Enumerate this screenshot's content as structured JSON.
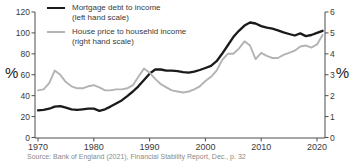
{
  "chart_data": {
    "type": "line",
    "x": [
      1970,
      1971,
      1972,
      1973,
      1974,
      1975,
      1976,
      1977,
      1978,
      1979,
      1980,
      1981,
      1982,
      1983,
      1984,
      1985,
      1986,
      1987,
      1988,
      1989,
      1990,
      1991,
      1992,
      1993,
      1994,
      1995,
      1996,
      1997,
      1998,
      1999,
      2000,
      2001,
      2002,
      2003,
      2004,
      2005,
      2006,
      2007,
      2008,
      2009,
      2010,
      2011,
      2012,
      2013,
      2014,
      2015,
      2016,
      2017,
      2018,
      2019,
      2020,
      2021
    ],
    "series": [
      {
        "id": "mortgage-debt-to-income",
        "name": "Mortgage debt to income",
        "scale_note": "(left hand scale)",
        "axis": "left",
        "color": "#1a1a1a",
        "values": [
          26,
          26.5,
          27.5,
          29.5,
          30,
          28.5,
          27,
          26.5,
          27,
          27.5,
          27.5,
          25.5,
          27,
          29.5,
          32.5,
          35.5,
          39.5,
          44,
          49,
          55,
          61,
          65,
          65,
          64,
          64,
          63.5,
          62.5,
          62,
          63,
          64.5,
          66.5,
          68.5,
          73,
          80,
          88,
          96,
          102,
          107,
          110,
          109,
          106.5,
          105,
          104,
          102.5,
          100.5,
          99,
          97.5,
          99.5,
          97,
          98,
          100,
          102
        ]
      },
      {
        "id": "house-price-to-income",
        "name": "House price to househld income",
        "scale_note": "(right hand scale)",
        "axis": "right",
        "color": "#b3b3b3",
        "values": [
          2.25,
          2.3,
          2.6,
          3.2,
          3.0,
          2.65,
          2.45,
          2.35,
          2.35,
          2.45,
          2.5,
          2.4,
          2.25,
          2.25,
          2.3,
          2.3,
          2.35,
          2.5,
          2.9,
          3.3,
          3.1,
          2.8,
          2.55,
          2.4,
          2.25,
          2.2,
          2.15,
          2.2,
          2.3,
          2.45,
          2.7,
          2.9,
          3.2,
          3.7,
          4.0,
          4.0,
          4.25,
          4.6,
          4.4,
          3.75,
          4.05,
          3.9,
          3.8,
          3.8,
          3.95,
          4.05,
          4.15,
          4.35,
          4.4,
          4.3,
          4.45,
          4.9
        ]
      }
    ],
    "left_axis": {
      "unit": "%",
      "min": 0,
      "max": 120,
      "ticks": [
        0,
        20,
        40,
        60,
        80,
        100,
        120
      ]
    },
    "right_axis": {
      "unit": "%",
      "min": 0,
      "max": 6,
      "ticks": [
        0,
        1,
        2,
        3,
        4,
        5,
        6
      ]
    },
    "x_ticks": [
      1970,
      1980,
      1990,
      2000,
      2010,
      2020
    ],
    "axis_color": "#4d4d4d",
    "grid": false,
    "legend_position": "top-left",
    "source": "Source: Bank of England (2021), Financial Stability Report, Dec., p. 32"
  }
}
